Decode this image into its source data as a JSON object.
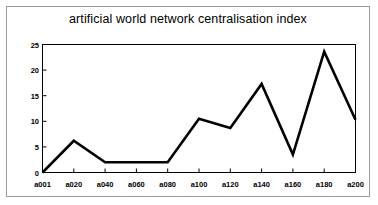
{
  "chart_data": {
    "type": "line",
    "title": "artificial world network centralisation index",
    "xlabel": "",
    "ylabel": "",
    "categories": [
      "a001",
      "a020",
      "a040",
      "a060",
      "a080",
      "a100",
      "a120",
      "a140",
      "a160",
      "a180",
      "a200"
    ],
    "values": [
      0.0,
      6.2,
      2.0,
      2.0,
      2.0,
      10.5,
      8.7,
      17.3,
      3.5,
      23.6,
      10.3
    ],
    "ylim": [
      0,
      25
    ],
    "yticks": [
      0,
      5,
      10,
      15,
      20,
      25
    ],
    "ytick_labels": [
      "0",
      "5",
      "10",
      "15",
      "20",
      "25"
    ],
    "grid": false,
    "legend": false,
    "legend_position": "none",
    "series_color": "#000000",
    "frame_color": "#000000",
    "background_color": "#ffffff",
    "border_color": "#9a9a9a"
  }
}
